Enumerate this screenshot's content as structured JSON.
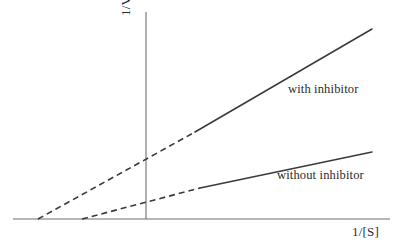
{
  "figure": {
    "background_color": "#ffffff",
    "line_color": "#3a3a3a",
    "axis_color": "#6e6e6e",
    "text_color": "#2b2b2b"
  },
  "axes": {
    "y_label": "1/V",
    "x_label": "1/[S]",
    "origin": {
      "x": 146,
      "y": 219
    },
    "y_axis_top": 12,
    "x_axis_left": 13,
    "x_axis_right": 390
  },
  "series_labels": {
    "with_inhibitor": "with inhibitor",
    "without_inhibitor": "without inhibitor"
  },
  "chart_data": {
    "type": "line",
    "title": "",
    "subtitle": "",
    "xlabel": "1/[S]",
    "ylabel": "1/V",
    "grid": false,
    "legend_position": "inline-right",
    "axis_style": "schematic-no-ticks",
    "xlim": [
      -1.0,
      1.4
    ],
    "ylim": [
      0,
      1.0
    ],
    "series": [
      {
        "name": "with inhibitor",
        "label": "with inhibitor",
        "style": "solid-with-dashed-extrapolation",
        "slope_px_per_px": -0.4102,
        "x_intercept_px": 38,
        "y_intercept_px": 172,
        "points_px": [
          {
            "x": 38,
            "y": 219,
            "role": "x-intercept"
          },
          {
            "x": 146,
            "y": 172,
            "role": "y-intercept"
          },
          {
            "x": 195,
            "y": 132,
            "role": "dash-to-solid-transition"
          },
          {
            "x": 372,
            "y": 29,
            "role": "line-end"
          }
        ],
        "dashed_segment_px": [
          {
            "x": 38,
            "y": 219
          },
          {
            "x": 195,
            "y": 132
          }
        ],
        "solid_segment_px": [
          {
            "x": 195,
            "y": 132
          },
          {
            "x": 372,
            "y": 29
          }
        ]
      },
      {
        "name": "without inhibitor",
        "label": "without inhibitor",
        "style": "solid-with-dashed-extrapolation",
        "slope_px_per_px": -0.1884,
        "x_intercept_px": 82,
        "y_intercept_px": 196,
        "points_px": [
          {
            "x": 82,
            "y": 219,
            "role": "x-intercept"
          },
          {
            "x": 146,
            "y": 196,
            "role": "y-intercept"
          },
          {
            "x": 200,
            "y": 188,
            "role": "dash-to-solid-transition"
          },
          {
            "x": 372,
            "y": 152,
            "role": "line-end"
          }
        ],
        "dashed_segment_px": [
          {
            "x": 82,
            "y": 219
          },
          {
            "x": 200,
            "y": 188
          }
        ],
        "solid_segment_px": [
          {
            "x": 200,
            "y": 188
          },
          {
            "x": 372,
            "y": 152
          }
        ]
      }
    ]
  }
}
